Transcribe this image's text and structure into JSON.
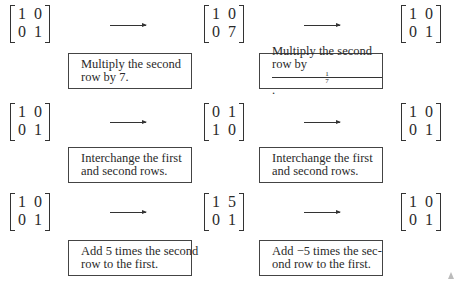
{
  "rows": [
    {
      "start": [
        [
          "1",
          "0"
        ],
        [
          "0",
          "1"
        ]
      ],
      "middle": [
        [
          "1",
          "0"
        ],
        [
          "0",
          "7"
        ]
      ],
      "end": [
        [
          "1",
          "0"
        ],
        [
          "0",
          "1"
        ]
      ],
      "op_forward": {
        "line1": "Multiply the second",
        "line2": "row by 7."
      },
      "op_inverse": {
        "line1": "Multiply the second",
        "line2_prefix": "row by ",
        "fraction_num": "1",
        "fraction_den": "7",
        "line2_suffix": "."
      }
    },
    {
      "start": [
        [
          "1",
          "0"
        ],
        [
          "0",
          "1"
        ]
      ],
      "middle": [
        [
          "0",
          "1"
        ],
        [
          "1",
          "0"
        ]
      ],
      "end": [
        [
          "1",
          "0"
        ],
        [
          "0",
          "1"
        ]
      ],
      "op_forward": {
        "line1": "Interchange the first",
        "line2": "and second rows."
      },
      "op_inverse": {
        "line1": "Interchange the first",
        "line2": "and second rows."
      }
    },
    {
      "start": [
        [
          "1",
          "0"
        ],
        [
          "0",
          "1"
        ]
      ],
      "middle": [
        [
          "1",
          "5"
        ],
        [
          "0",
          "1"
        ]
      ],
      "end": [
        [
          "1",
          "0"
        ],
        [
          "0",
          "1"
        ]
      ],
      "op_forward": {
        "line1": "Add 5 times the second",
        "line2": "row to the first."
      },
      "op_inverse": {
        "line1": "Add −5 times the sec-",
        "line2": "ond row to the first."
      }
    }
  ]
}
